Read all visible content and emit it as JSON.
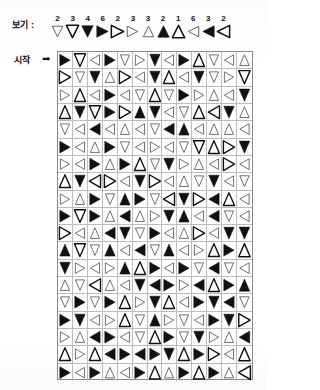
{
  "legend": {
    "label": "보기 :",
    "items": [
      {
        "num": "2",
        "dir": "down",
        "fill": "outline"
      },
      {
        "num": "3",
        "dir": "down",
        "fill": "outline-bold"
      },
      {
        "num": "4",
        "dir": "down",
        "fill": "solid"
      },
      {
        "num": "6",
        "dir": "right",
        "fill": "solid"
      },
      {
        "num": "2",
        "dir": "right",
        "fill": "outline-bold"
      },
      {
        "num": "3",
        "dir": "right",
        "fill": "outline"
      },
      {
        "num": "3",
        "dir": "up",
        "fill": "outline"
      },
      {
        "num": "2",
        "dir": "up",
        "fill": "solid"
      },
      {
        "num": "1",
        "dir": "up",
        "fill": "outline-bold"
      },
      {
        "num": "6",
        "dir": "left",
        "fill": "outline"
      },
      {
        "num": "3",
        "dir": "left",
        "fill": "solid"
      },
      {
        "num": "2",
        "dir": "left",
        "fill": "outline-bold"
      }
    ]
  },
  "start": {
    "label": "시작",
    "arrow": "➡"
  },
  "colors": {
    "ink": "#111111",
    "grid_line": "#bdbdbd",
    "grid_border": "#8a8a8a",
    "page": "#ffffff"
  },
  "grid": {
    "rows": 19,
    "cols": 13,
    "cells": [
      [
        "right-solid",
        "down-outline-bold",
        "left-outline",
        "right-solid",
        "down-outline",
        "right-outline",
        "down-solid",
        "left-outline",
        "right-solid",
        "up-outline-bold",
        "down-outline",
        "left-outline",
        "up-outline",
        "down-solid"
      ],
      [
        "right-outline-bold",
        "down-outline",
        "down-solid",
        "up-outline",
        "right-outline-bold",
        "left-outline",
        "down-solid",
        "up-outline-bold",
        "left-outline",
        "down-solid",
        "down-outline",
        "right-outline",
        "down-outline-bold",
        "down-solid"
      ],
      [
        "right-outline",
        "up-outline-bold",
        "left-outline",
        "right-solid",
        "left-outline",
        "down-outline",
        "up-outline-bold",
        "down-outline",
        "right-solid",
        "right-outline",
        "up-outline",
        "left-outline",
        "down-solid",
        "up-solid"
      ],
      [
        "up-outline-bold",
        "down-solid",
        "down-outline-bold",
        "right-solid",
        "right-outline-bold",
        "up-solid",
        "down-solid",
        "left-outline",
        "down-outline",
        "up-outline-bold",
        "left-outline-bold",
        "down-solid",
        "up-outline",
        "left-solid"
      ],
      [
        "down-outline",
        "left-outline",
        "left-solid",
        "left-outline",
        "up-outline",
        "left-outline",
        "down-outline",
        "left-solid",
        "up-solid",
        "left-outline",
        "up-outline",
        "up-outline",
        "left-outline",
        "down-solid"
      ],
      [
        "right-solid",
        "left-outline",
        "up-outline",
        "right-solid",
        "down-outline",
        "left-outline",
        "right-outline",
        "left-outline",
        "down-outline",
        "down-outline-bold",
        "up-outline-bold",
        "right-outline-bold",
        "down-solid",
        "left-solid"
      ],
      [
        "right-outline",
        "left-outline",
        "right-solid",
        "up-outline",
        "right-solid",
        "up-outline-bold",
        "down-outline",
        "down-solid",
        "right-outline",
        "up-outline",
        "left-outline",
        "right-outline-bold",
        "left-outline",
        "down-solid"
      ],
      [
        "up-outline-bold",
        "down-solid",
        "left-outline-bold",
        "right-outline-bold",
        "left-outline",
        "down-solid",
        "right-outline-bold",
        "left-outline",
        "up-outline",
        "down-outline",
        "down-solid",
        "left-outline",
        "down-outline",
        "up-outline"
      ],
      [
        "right-outline",
        "up-outline",
        "right-solid",
        "down-outline",
        "up-solid",
        "right-solid",
        "down-outline",
        "left-outline-bold",
        "down-solid",
        "right-outline-bold",
        "left-solid",
        "up-outline-bold",
        "left-outline",
        "down-outline"
      ],
      [
        "right-solid",
        "down-outline-bold",
        "right-solid",
        "up-outline",
        "left-solid",
        "up-outline",
        "right-outline",
        "down-solid",
        "up-solid",
        "left-outline",
        "left-solid",
        "down-outline",
        "left-outline",
        "left-solid"
      ],
      [
        "right-outline-bold",
        "left-outline",
        "up-outline",
        "left-solid",
        "down-solid",
        "down-outline",
        "right-solid",
        "left-outline",
        "up-outline",
        "right-outline-bold",
        "left-outline",
        "down-solid",
        "down-solid",
        "up-outline"
      ],
      [
        "up-solid",
        "down-outline-bold",
        "down-outline",
        "up-solid",
        "left-outline",
        "left-solid",
        "down-outline",
        "up-solid",
        "left-outline",
        "right-outline",
        "up-outline-bold",
        "right-solid",
        "up-outline-bold",
        "down-outline"
      ],
      [
        "down-solid",
        "right-outline",
        "left-outline",
        "right-outline",
        "up-solid",
        "up-outline-bold",
        "right-solid",
        "left-outline",
        "right-solid",
        "down-outline",
        "left-solid",
        "down-outline",
        "left-outline",
        "right-solid"
      ],
      [
        "up-outline",
        "down-outline",
        "left-outline-bold",
        "up-outline",
        "left-outline",
        "down-solid",
        "left-solid",
        "right-solid",
        "right-outline",
        "left-solid",
        "up-outline-bold",
        "right-solid",
        "up-solid",
        "down-solid"
      ],
      [
        "down-outline",
        "right-solid",
        "down-outline",
        "right-solid",
        "up-outline-bold",
        "right-outline",
        "down-solid",
        "up-outline-bold",
        "left-outline",
        "right-solid",
        "down-solid",
        "left-solid",
        "down-outline",
        "down-solid"
      ],
      [
        "right-solid",
        "down-solid",
        "left-outline",
        "right-outline",
        "up-outline-bold",
        "down-outline",
        "up-solid",
        "right-outline",
        "down-outline",
        "left-outline",
        "right-solid",
        "down-solid",
        "right-outline-bold",
        "left-outline"
      ],
      [
        "right-outline",
        "up-outline",
        "left-solid",
        "right-solid",
        "left-outline",
        "down-outline",
        "up-outline-bold",
        "right-solid",
        "down-outline",
        "down-solid",
        "right-outline",
        "up-outline",
        "left-solid",
        "left-outline"
      ],
      [
        "up-outline-bold",
        "right-outline",
        "up-outline-bold",
        "left-solid",
        "right-solid",
        "left-solid",
        "right-solid",
        "down-solid",
        "up-outline-bold",
        "right-solid",
        "right-outline-bold",
        "left-outline",
        "up-outline-bold",
        "left-solid"
      ],
      [
        "right-solid",
        "left-outline",
        "right-solid",
        "up-outline",
        "left-outline",
        "right-solid",
        "up-outline-bold",
        "up-outline",
        "right-solid",
        "up-outline-bold",
        "right-solid",
        "up-outline",
        "left-outline-bold",
        "gem"
      ]
    ]
  }
}
